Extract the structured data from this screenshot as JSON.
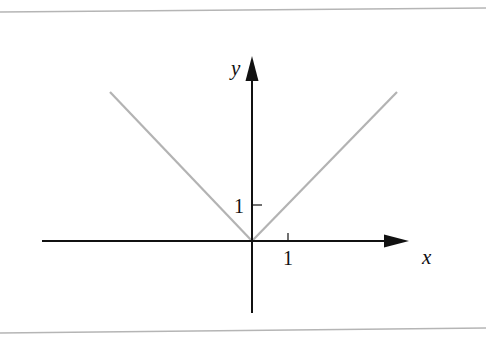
{
  "figure": {
    "type": "function-graph",
    "function": "y = |x|",
    "border_color": "#b5b5b5",
    "axis_color": "#111111",
    "curve_color": "#b3b3b3",
    "axes": {
      "x_label": "x",
      "y_label": "y",
      "x_tick_label": "1",
      "y_tick_label": "1"
    },
    "curve": {
      "points": [
        [
          -4,
          4
        ],
        [
          0,
          0
        ],
        [
          4,
          4
        ]
      ]
    }
  }
}
